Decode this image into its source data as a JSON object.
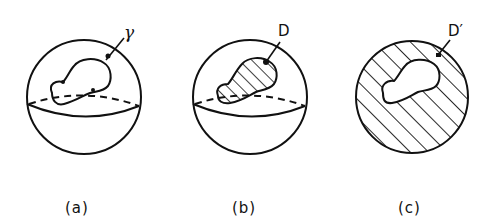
{
  "figure": {
    "panels": [
      {
        "id": "a",
        "caption": "(a)",
        "label": "γ",
        "description": "Sphere with closed curve gamma on upper hemisphere"
      },
      {
        "id": "b",
        "caption": "(b)",
        "label": "D",
        "description": "Sphere with hatched disk D bounded by curve"
      },
      {
        "id": "c",
        "caption": "(c)",
        "label": "D′",
        "description": "Sphere with hatched complementary disk D′"
      }
    ],
    "colors": {
      "stroke": "#111111",
      "background": "#ffffff"
    }
  }
}
